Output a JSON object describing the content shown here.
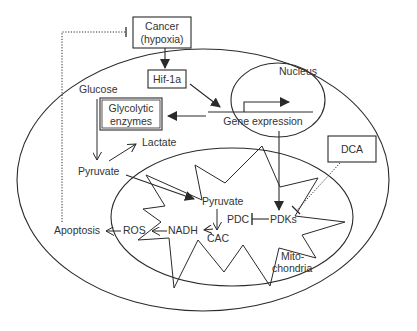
{
  "diagram": {
    "colors": {
      "line": "#2a2a2a",
      "text": "#333333",
      "background": "#ffffff"
    },
    "compartments": {
      "cell": {
        "label": ""
      },
      "nucleus": {
        "label": "Nucleus"
      },
      "mitochondria": {
        "label_line1": "Mito-",
        "label_line2": "chondria"
      }
    },
    "nodes": {
      "cancer": {
        "line1": "Cancer",
        "line2": "(hypoxia)"
      },
      "hif": {
        "label": "Hif-1a"
      },
      "glucose": {
        "label": "Glucose"
      },
      "glycolytic": {
        "line1": "Glycolytic",
        "line2": "enzymes"
      },
      "lactate": {
        "label": "Lactate"
      },
      "pyruvate_cyto": {
        "label": "Pyruvate"
      },
      "gene_expression": {
        "label": "Gene expression"
      },
      "dca": {
        "label": "DCA"
      },
      "pyruvate_mito": {
        "label": "Pyruvate"
      },
      "pdc": {
        "label": "PDC"
      },
      "pdks": {
        "label": "PDKs"
      },
      "nadh": {
        "label": "NADH"
      },
      "cac": {
        "label": "CAC"
      },
      "ros": {
        "label": "ROS"
      },
      "apoptosis": {
        "label": "Apoptosis"
      }
    },
    "edges": [
      {
        "from": "Cancer (hypoxia)",
        "to": "Hif-1a",
        "type": "activation"
      },
      {
        "from": "Hif-1a",
        "to": "Gene expression",
        "type": "activation"
      },
      {
        "from": "Gene expression",
        "to": "Glycolytic enzymes",
        "type": "activation"
      },
      {
        "from": "Gene expression",
        "to": "PDKs",
        "type": "activation"
      },
      {
        "from": "Glucose",
        "to": "Pyruvate",
        "type": "conversion"
      },
      {
        "from": "Pyruvate",
        "to": "Lactate",
        "type": "conversion"
      },
      {
        "from": "Pyruvate",
        "to": "Pyruvate (mitochondria)",
        "type": "transport"
      },
      {
        "from": "Pyruvate (mitochondria)",
        "to": "CAC",
        "type": "conversion"
      },
      {
        "from": "CAC",
        "to": "NADH",
        "type": "conversion"
      },
      {
        "from": "NADH",
        "to": "ROS",
        "type": "conversion"
      },
      {
        "from": "ROS",
        "to": "Apoptosis",
        "type": "activation"
      },
      {
        "from": "PDKs",
        "to": "PDC",
        "type": "inhibition"
      },
      {
        "from": "DCA",
        "to": "PDKs",
        "type": "inhibition (dotted)"
      },
      {
        "from": "Apoptosis",
        "to": "Cancer (hypoxia)",
        "type": "inhibition (dotted)"
      }
    ]
  }
}
